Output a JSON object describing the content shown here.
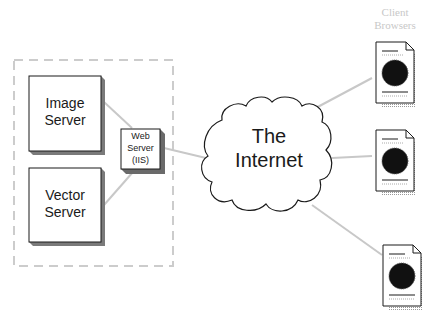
{
  "diagram": {
    "colors": {
      "box_fill": "#ffffff",
      "box_border": "#1a1a1a",
      "box_shadow": "#808080",
      "connector": "#c8c8c8",
      "dashed_border": "#cccccc",
      "cloud_border": "#1a1a1a",
      "client_label": "#c8c8c8"
    },
    "nodes": {
      "image_server": {
        "line1": "Image",
        "line2": "Server"
      },
      "vector_server": {
        "line1": "Vector",
        "line2": "Server"
      },
      "web_server": {
        "line1": "Web",
        "line2": "Server",
        "line3": "(IIS)"
      },
      "internet": {
        "line1": "The",
        "line2": "Internet"
      },
      "clients": {
        "line1": "Client",
        "line2": "Browsers",
        "count": 3
      }
    },
    "icons": {
      "client_document": "document-with-globe-icon",
      "cloud": "cloud-icon"
    }
  }
}
